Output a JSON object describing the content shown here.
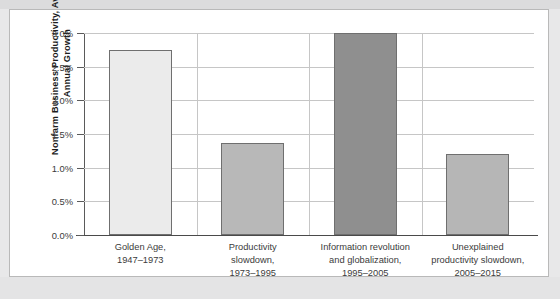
{
  "chart_data": {
    "type": "bar",
    "title": "",
    "subtitle": "",
    "xlabel": "",
    "ylabel": "Nonfarm Business Productivity,\nAverage Annual Growth",
    "categories": [
      "Golden Age,\n1947–1973",
      "Productivity\nslowdown,\n1973–1995",
      "Information revolution\nand globalization,\n1995–2005",
      "Unexplained\nproductivity slowdown,\n2005–2015"
    ],
    "values": [
      2.75,
      1.37,
      3.0,
      1.2
    ],
    "value_unit": "%",
    "ylim": [
      0,
      3.0
    ],
    "ytick_values": [
      0.0,
      0.5,
      1.0,
      1.5,
      2.0,
      2.5,
      3.0
    ],
    "ytick_labels": [
      "0.0%",
      "0.5%",
      "1.0%",
      "1.5%",
      "2.0%",
      "2.5%",
      "3.0%"
    ],
    "grid": true,
    "legend": false,
    "legend_position": "none",
    "bar_colors": [
      "#ebebeb",
      "#b8b8b8",
      "#8f8f8f",
      "#b6b6b6"
    ],
    "bar_border_color": "#6f6f6f",
    "gridline_color": "#c6c6c6",
    "axis_color": "#4a4a4a",
    "panel_background": "#ffffff",
    "page_background": "#e8e8e9"
  }
}
